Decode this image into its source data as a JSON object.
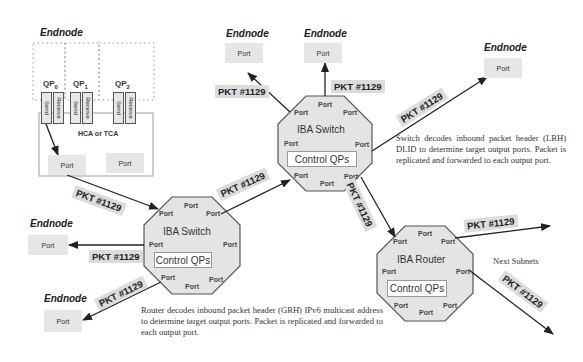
{
  "diagram": {
    "endnode_title": "Endnode",
    "port_label": "Port",
    "packet_label": "PKT #1129",
    "control_qps_label": "Control QPs",
    "hca_label": "HCA or TCA",
    "send_label": "Send",
    "receive_label": "Receive",
    "qps": [
      {
        "name": "QP",
        "sub": "0"
      },
      {
        "name": "QP",
        "sub": "1"
      },
      {
        "name": "QP",
        "sub": "2"
      }
    ],
    "switch_top_label": "IBA Switch",
    "switch_left_label": "IBA Switch",
    "router_label": "IBA Router",
    "next_subnets": "Next Subnets",
    "switch_description": "Switch decodes inbound packet header (LRH) DLID to determine target output ports. Packet is replicated and forwarded to each output port.",
    "router_description": "Router decodes inbound packet header (GRH) IPv6 multicast address to determine target output ports. Packet is replicated and forwarded to each output port.",
    "colors": {
      "octagon_fill": "#e4e4e4",
      "octagon_stroke": "#555555",
      "port_fill": "#e6e6e6",
      "packet_fill": "#dcdcdc",
      "arrow": "#222222"
    }
  }
}
